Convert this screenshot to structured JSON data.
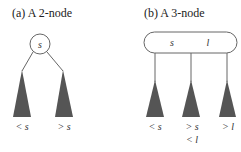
{
  "panel_a": {
    "title": "(a) A 2-node",
    "node_key": "s",
    "left_label": "< s",
    "right_label": "> s"
  },
  "panel_b": {
    "title": "(b) A 3-node",
    "node_key_1": "s",
    "node_key_2": "l",
    "left_label": "< s",
    "middle_label_1": "> s",
    "middle_label_2": "< l",
    "right_label": "> l"
  },
  "colors": {
    "subtree_fill": "#555555",
    "stroke": "#666666",
    "background": "#ffffff"
  }
}
